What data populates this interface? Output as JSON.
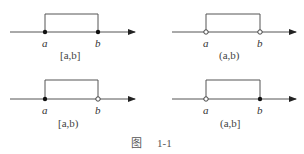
{
  "figure": {
    "caption_prefix": "图",
    "caption_number": "1-1"
  },
  "panels": [
    {
      "id": "closed",
      "interval_label": "[a,b]",
      "left_label": "a",
      "right_label": "b",
      "left_endpoint": "closed",
      "right_endpoint": "closed"
    },
    {
      "id": "open",
      "interval_label": "(a,b)",
      "left_label": "a",
      "right_label": "b",
      "left_endpoint": "open",
      "right_endpoint": "open"
    },
    {
      "id": "left-closed-right-open",
      "interval_label": "[a,b)",
      "left_label": "a",
      "right_label": "b",
      "left_endpoint": "closed",
      "right_endpoint": "open"
    },
    {
      "id": "left-open-right-closed",
      "interval_label": "(a,b]",
      "left_label": "a",
      "right_label": "b",
      "left_endpoint": "open",
      "right_endpoint": "closed"
    }
  ],
  "colors": {
    "line": "#555555",
    "dot": "#111111"
  }
}
